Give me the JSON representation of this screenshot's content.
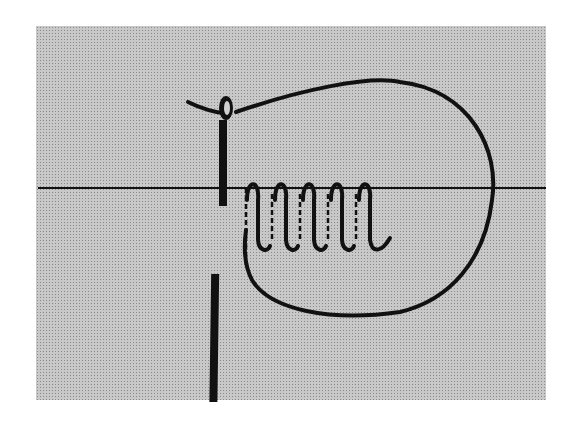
{
  "diagram": {
    "colors": {
      "background": "#ffffff",
      "panel_screen": "#c8c8c8",
      "ink": "#111111"
    },
    "elements": {
      "fabric_line": "fabric-edge",
      "needle": "needle",
      "thread_loop": "thread-loop",
      "coil_wraps": 5
    }
  }
}
